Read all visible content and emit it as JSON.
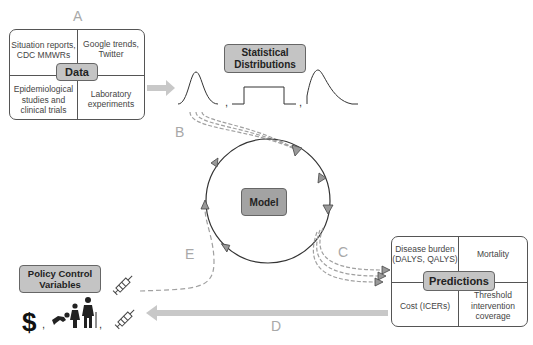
{
  "letters": {
    "a": "A",
    "b": "B",
    "c": "C",
    "d": "D",
    "e": "E"
  },
  "data_box": {
    "title": "Data",
    "cells": {
      "top_left": "Situation reports, CDC MMWRs",
      "top_right": "Google trends, Twitter",
      "bottom_left": "Epidemiological studies and clinical trials",
      "bottom_right": "Laboratory experiments"
    }
  },
  "distributions": {
    "title_line1": "Statistical",
    "title_line2": "Distributions",
    "separators": [
      ",",
      ","
    ]
  },
  "model": {
    "title": "Model"
  },
  "predictions_box": {
    "title": "Predictions",
    "cells": {
      "top_left": "Disease burden (DALYS, QALYS)",
      "top_right": "Mortality",
      "bottom_left": "Cost (ICERs)",
      "bottom_right": "Threshold intervention coverage"
    }
  },
  "policy": {
    "title_line1": "Policy Control",
    "title_line2": "Variables",
    "dollar": "$",
    "separators": [
      ",",
      ","
    ]
  },
  "colors": {
    "tag_fill": "#c4c4c4",
    "model_fill": "#a3a3a3",
    "arrow_fill": "#c8c8c8",
    "dashed": "#a0a0a0",
    "letter": "#a8a8a8",
    "line": "#333333"
  }
}
